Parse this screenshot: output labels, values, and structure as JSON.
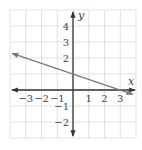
{
  "chart_data": {
    "type": "line",
    "title": "",
    "xlabel": "x",
    "ylabel": "y",
    "xlim": [
      -4,
      4
    ],
    "ylim": [
      -3,
      5
    ],
    "grid": true,
    "x_ticks": [
      -3,
      -2,
      -1,
      1,
      2,
      3
    ],
    "y_ticks": [
      4,
      3,
      2,
      -1,
      -2
    ],
    "x_tick_labels": [
      "−3",
      "−2",
      "−1",
      "1",
      "2",
      "3"
    ],
    "y_tick_labels": [
      "4",
      "3",
      "2",
      "−1",
      "−2"
    ],
    "series": [
      {
        "name": "line",
        "equation": "y = -x/3 + 1",
        "slope": -0.3333,
        "intercept": 1,
        "points": [
          [
            -3.87,
            2.29
          ],
          [
            0,
            1
          ],
          [
            3,
            0
          ],
          [
            3.8,
            -0.27
          ]
        ],
        "arrows": "both",
        "color": "#7a7a7a"
      }
    ]
  },
  "colors": {
    "grid": "#d9d9d9",
    "axis": "#333333",
    "line": "#7a7a7a"
  }
}
